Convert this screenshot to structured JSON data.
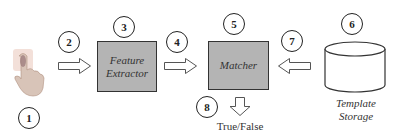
{
  "diagram": {
    "type": "fingerprint-verification-pipeline",
    "nodes": [
      {
        "id": "sensor",
        "step": "1",
        "label": "",
        "icon": "finger-touch-icon"
      },
      {
        "id": "feature_extractor",
        "step": "3",
        "label_line1": "Feature",
        "label_line2": "Extractor"
      },
      {
        "id": "matcher",
        "step": "5",
        "label": "Matcher"
      },
      {
        "id": "template_storage",
        "step": "6",
        "label_line1": "Template",
        "label_line2": "Storage"
      }
    ],
    "edges": [
      {
        "from": "sensor",
        "to": "feature_extractor",
        "step": "2"
      },
      {
        "from": "feature_extractor",
        "to": "matcher",
        "step": "4"
      },
      {
        "from": "template_storage",
        "to": "matcher",
        "step": "7"
      },
      {
        "from": "matcher",
        "to": "output",
        "step": "8"
      }
    ],
    "output": {
      "label": "True/False"
    },
    "colors": {
      "box_fill": "#b4b4b4",
      "stroke": "#333333",
      "background": "#ffffff"
    }
  }
}
